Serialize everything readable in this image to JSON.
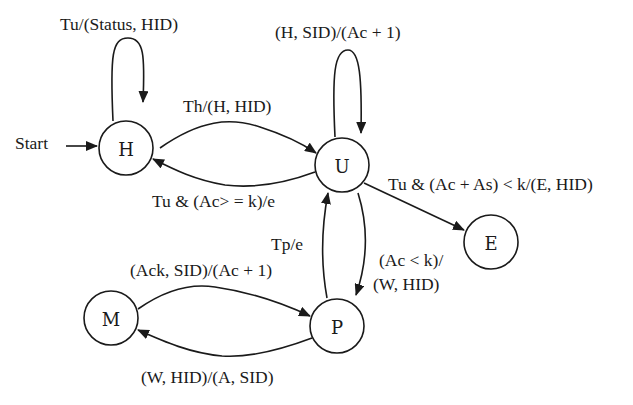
{
  "diagram": {
    "type": "state-machine",
    "states": [
      {
        "id": "H",
        "label": "H",
        "initial": true
      },
      {
        "id": "U",
        "label": "U"
      },
      {
        "id": "E",
        "label": "E"
      },
      {
        "id": "M",
        "label": "M"
      },
      {
        "id": "P",
        "label": "P"
      }
    ],
    "start_label": "Start",
    "transitions": [
      {
        "from": "H",
        "to": "H",
        "label": "Tu/(Status, HID)"
      },
      {
        "from": "H",
        "to": "U",
        "label": "Th/(H, HID)"
      },
      {
        "from": "U",
        "to": "H",
        "label": "Tu & (Ac> = k)/e"
      },
      {
        "from": "U",
        "to": "U",
        "label": "(H, SID)/(Ac + 1)"
      },
      {
        "from": "U",
        "to": "E",
        "label": "Tu & (Ac + As) < k/(E, HID)"
      },
      {
        "from": "U",
        "to": "P",
        "label_lines": [
          "(Ac < k)/",
          "(W, HID)"
        ]
      },
      {
        "from": "P",
        "to": "U",
        "label": "Tp/e"
      },
      {
        "from": "M",
        "to": "P",
        "label": "(Ack, SID)/(Ac + 1)"
      },
      {
        "from": "P",
        "to": "M",
        "label": "(W, HID)/(A, SID)"
      }
    ]
  }
}
